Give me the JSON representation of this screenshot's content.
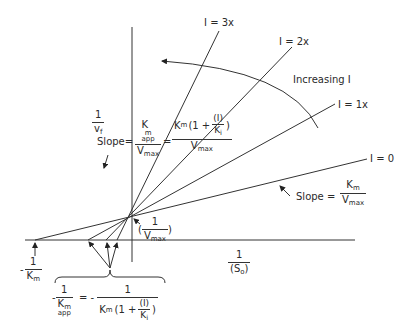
{
  "diagram": {
    "type": "Lineweaver-Burk plot, competitive inhibition",
    "axes": {
      "y_label_num": "1",
      "y_label_den": "v",
      "y_label_den_sub": "f",
      "x_label_num": "1",
      "x_label_den": "(S",
      "x_label_den_sub": "o",
      "x_label_den_close": ")"
    },
    "lines": [
      {
        "label": "I = 3x"
      },
      {
        "label": "I = 2x"
      },
      {
        "label": "I = 1x"
      },
      {
        "label": "I = 0"
      }
    ],
    "arrow_label": "Increasing I",
    "slope_inhibited": {
      "prefix": "Slope=",
      "k_num": "K",
      "k_num_sub": "m",
      "k_num_subsub": "app",
      "v_den": "V",
      "v_den_sub": "max",
      "equals": "=",
      "rhs_num": "K",
      "rhs_num_sub": "m",
      "rhs_num_open": "(1 +",
      "rhs_inner_num": "(I)",
      "rhs_inner_den": "K",
      "rhs_inner_den_sub": "i",
      "rhs_num_close": ")",
      "rhs_den": "V",
      "rhs_den_sub": "max"
    },
    "slope_uninhibited": {
      "prefix": "Slope =",
      "num": "K",
      "num_sub": "m",
      "den": "V",
      "den_sub": "max"
    },
    "y_intercept": {
      "open": "(",
      "num": "1",
      "den": "V",
      "den_sub": "max",
      "close": ")"
    },
    "x_intercept": {
      "sign": "-",
      "num": "1",
      "den": "K",
      "den_sub": "m"
    },
    "x_intercept_app": {
      "sign": "-",
      "num": "1",
      "den": "K",
      "den_sub": "m",
      "den_subsub": "app",
      "equals": "= -",
      "rhs_num": "1",
      "rhs_den": "K",
      "rhs_den_sub": "m",
      "rhs_open": "(1 +",
      "rhs_inner_num": "(I)",
      "rhs_inner_den": "K",
      "rhs_inner_den_sub": "i",
      "rhs_close": ")"
    }
  }
}
